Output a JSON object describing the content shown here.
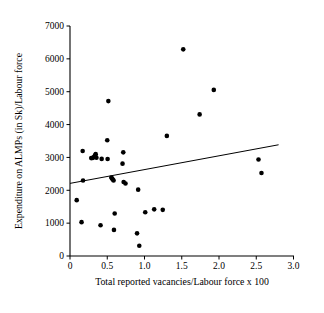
{
  "chart_data": {
    "type": "scatter",
    "title": "",
    "xlabel": "Total reported vacancies/Labour force x 100",
    "ylabel": "Expenditure on ALMPs (in Sk)/Labour force",
    "xlim": [
      0,
      3.0
    ],
    "ylim": [
      0,
      7000
    ],
    "xticks": [
      "0",
      "0.5",
      "1.0",
      "1.5",
      "2.0",
      "2.5",
      "3.0"
    ],
    "xtick_values": [
      0,
      0.5,
      1.0,
      1.5,
      2.0,
      2.5,
      3.0
    ],
    "yticks": [
      "0",
      "1000",
      "2000",
      "3000",
      "4000",
      "5000",
      "6000",
      "7000"
    ],
    "ytick_values": [
      0,
      1000,
      2000,
      3000,
      4000,
      5000,
      6000,
      7000
    ],
    "grid": false,
    "legend": null,
    "marker": "filled-circle",
    "marker_color": "#000000",
    "points": [
      {
        "x": 0.09,
        "y": 1700
      },
      {
        "x": 0.155,
        "y": 1030
      },
      {
        "x": 0.17,
        "y": 3195
      },
      {
        "x": 0.175,
        "y": 2300
      },
      {
        "x": 0.285,
        "y": 2980
      },
      {
        "x": 0.305,
        "y": 2985
      },
      {
        "x": 0.325,
        "y": 3020
      },
      {
        "x": 0.335,
        "y": 3065
      },
      {
        "x": 0.345,
        "y": 3100
      },
      {
        "x": 0.355,
        "y": 2990
      },
      {
        "x": 0.41,
        "y": 935
      },
      {
        "x": 0.425,
        "y": 2955
      },
      {
        "x": 0.5,
        "y": 3525
      },
      {
        "x": 0.505,
        "y": 2950
      },
      {
        "x": 0.515,
        "y": 4715
      },
      {
        "x": 0.555,
        "y": 2390
      },
      {
        "x": 0.565,
        "y": 2355
      },
      {
        "x": 0.575,
        "y": 2330
      },
      {
        "x": 0.585,
        "y": 2300
      },
      {
        "x": 0.59,
        "y": 795
      },
      {
        "x": 0.6,
        "y": 1295
      },
      {
        "x": 0.705,
        "y": 2810
      },
      {
        "x": 0.715,
        "y": 3155
      },
      {
        "x": 0.72,
        "y": 2250
      },
      {
        "x": 0.745,
        "y": 2205
      },
      {
        "x": 0.9,
        "y": 690
      },
      {
        "x": 0.915,
        "y": 2020
      },
      {
        "x": 0.93,
        "y": 310
      },
      {
        "x": 1.01,
        "y": 1330
      },
      {
        "x": 1.13,
        "y": 1420
      },
      {
        "x": 1.245,
        "y": 1405
      },
      {
        "x": 1.3,
        "y": 3655
      },
      {
        "x": 1.52,
        "y": 6290
      },
      {
        "x": 1.74,
        "y": 4310
      },
      {
        "x": 1.93,
        "y": 5055
      },
      {
        "x": 2.53,
        "y": 2935
      },
      {
        "x": 2.57,
        "y": 2525
      }
    ],
    "trend_line": {
      "type": "linear-fit",
      "x0": 0.0,
      "y0": 2210,
      "x1": 2.8,
      "y1": 3385
    }
  }
}
